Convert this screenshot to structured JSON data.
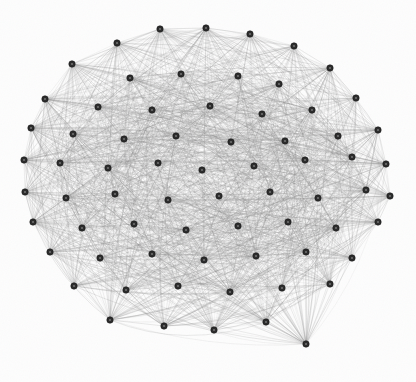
{
  "figure": {
    "name": "network-graph",
    "type": "force-directed-node-link-diagram",
    "width": 416,
    "height": 382,
    "background_color": "#fdfdfd",
    "has_title": false,
    "has_axes": false,
    "has_legend": false,
    "has_labels": false
  },
  "style": {
    "node_fill": "#2a2a2a",
    "node_stroke": "#151515",
    "node_core_fill": "#6e6e6e",
    "node_radius": 3.2,
    "node_core_radius": 1.1,
    "edge_color": "#8c8c8c",
    "edge_width": 0.45,
    "edge_opacity": 0.3
  },
  "chart_data": {
    "type": "graph",
    "title": "",
    "subtitle": "",
    "xlabel": "",
    "ylabel": "",
    "grid": false,
    "legend": "none",
    "layout": "circular-force-directed",
    "center": [
      207,
      183
    ],
    "radius": 184,
    "node_count": 70,
    "edge_count": 1587,
    "edge_density": 0.657,
    "nodes": [
      {
        "id": 0,
        "x": 160,
        "y": 29
      },
      {
        "id": 1,
        "x": 206,
        "y": 28
      },
      {
        "id": 2,
        "x": 250,
        "y": 34
      },
      {
        "id": 3,
        "x": 117,
        "y": 43
      },
      {
        "id": 4,
        "x": 294,
        "y": 46
      },
      {
        "id": 5,
        "x": 72,
        "y": 64
      },
      {
        "id": 6,
        "x": 330,
        "y": 68
      },
      {
        "id": 7,
        "x": 181,
        "y": 74
      },
      {
        "id": 8,
        "x": 130,
        "y": 78
      },
      {
        "id": 9,
        "x": 238,
        "y": 76
      },
      {
        "id": 10,
        "x": 279,
        "y": 84
      },
      {
        "id": 11,
        "x": 356,
        "y": 98
      },
      {
        "id": 12,
        "x": 45,
        "y": 99
      },
      {
        "id": 13,
        "x": 98,
        "y": 107
      },
      {
        "id": 14,
        "x": 152,
        "y": 110
      },
      {
        "id": 15,
        "x": 210,
        "y": 106
      },
      {
        "id": 16,
        "x": 262,
        "y": 114
      },
      {
        "id": 17,
        "x": 312,
        "y": 110
      },
      {
        "id": 18,
        "x": 31,
        "y": 128
      },
      {
        "id": 19,
        "x": 73,
        "y": 134
      },
      {
        "id": 20,
        "x": 124,
        "y": 139
      },
      {
        "id": 21,
        "x": 176,
        "y": 136
      },
      {
        "id": 22,
        "x": 231,
        "y": 142
      },
      {
        "id": 23,
        "x": 285,
        "y": 141
      },
      {
        "id": 24,
        "x": 338,
        "y": 136
      },
      {
        "id": 25,
        "x": 378,
        "y": 130
      },
      {
        "id": 26,
        "x": 24,
        "y": 160
      },
      {
        "id": 27,
        "x": 60,
        "y": 163
      },
      {
        "id": 28,
        "x": 108,
        "y": 168
      },
      {
        "id": 29,
        "x": 158,
        "y": 163
      },
      {
        "id": 30,
        "x": 202,
        "y": 170
      },
      {
        "id": 31,
        "x": 254,
        "y": 166
      },
      {
        "id": 32,
        "x": 305,
        "y": 160
      },
      {
        "id": 33,
        "x": 352,
        "y": 157
      },
      {
        "id": 34,
        "x": 386,
        "y": 164
      },
      {
        "id": 35,
        "x": 25,
        "y": 192
      },
      {
        "id": 36,
        "x": 66,
        "y": 198
      },
      {
        "id": 37,
        "x": 115,
        "y": 194
      },
      {
        "id": 38,
        "x": 168,
        "y": 200
      },
      {
        "id": 39,
        "x": 219,
        "y": 196
      },
      {
        "id": 40,
        "x": 270,
        "y": 192
      },
      {
        "id": 41,
        "x": 318,
        "y": 198
      },
      {
        "id": 42,
        "x": 366,
        "y": 190
      },
      {
        "id": 43,
        "x": 390,
        "y": 196
      },
      {
        "id": 44,
        "x": 33,
        "y": 222
      },
      {
        "id": 45,
        "x": 82,
        "y": 228
      },
      {
        "id": 46,
        "x": 134,
        "y": 224
      },
      {
        "id": 47,
        "x": 186,
        "y": 230
      },
      {
        "id": 48,
        "x": 238,
        "y": 226
      },
      {
        "id": 49,
        "x": 288,
        "y": 222
      },
      {
        "id": 50,
        "x": 336,
        "y": 228
      },
      {
        "id": 51,
        "x": 378,
        "y": 222
      },
      {
        "id": 52,
        "x": 50,
        "y": 252
      },
      {
        "id": 53,
        "x": 100,
        "y": 258
      },
      {
        "id": 54,
        "x": 152,
        "y": 254
      },
      {
        "id": 55,
        "x": 204,
        "y": 260
      },
      {
        "id": 56,
        "x": 256,
        "y": 256
      },
      {
        "id": 57,
        "x": 306,
        "y": 252
      },
      {
        "id": 58,
        "x": 352,
        "y": 258
      },
      {
        "id": 59,
        "x": 74,
        "y": 286
      },
      {
        "id": 60,
        "x": 126,
        "y": 290
      },
      {
        "id": 61,
        "x": 178,
        "y": 286
      },
      {
        "id": 62,
        "x": 230,
        "y": 292
      },
      {
        "id": 63,
        "x": 282,
        "y": 288
      },
      {
        "id": 64,
        "x": 330,
        "y": 284
      },
      {
        "id": 65,
        "x": 110,
        "y": 320
      },
      {
        "id": 66,
        "x": 164,
        "y": 326
      },
      {
        "id": 67,
        "x": 214,
        "y": 330
      },
      {
        "id": 68,
        "x": 266,
        "y": 322
      },
      {
        "id": 69,
        "x": 306,
        "y": 344
      }
    ]
  }
}
